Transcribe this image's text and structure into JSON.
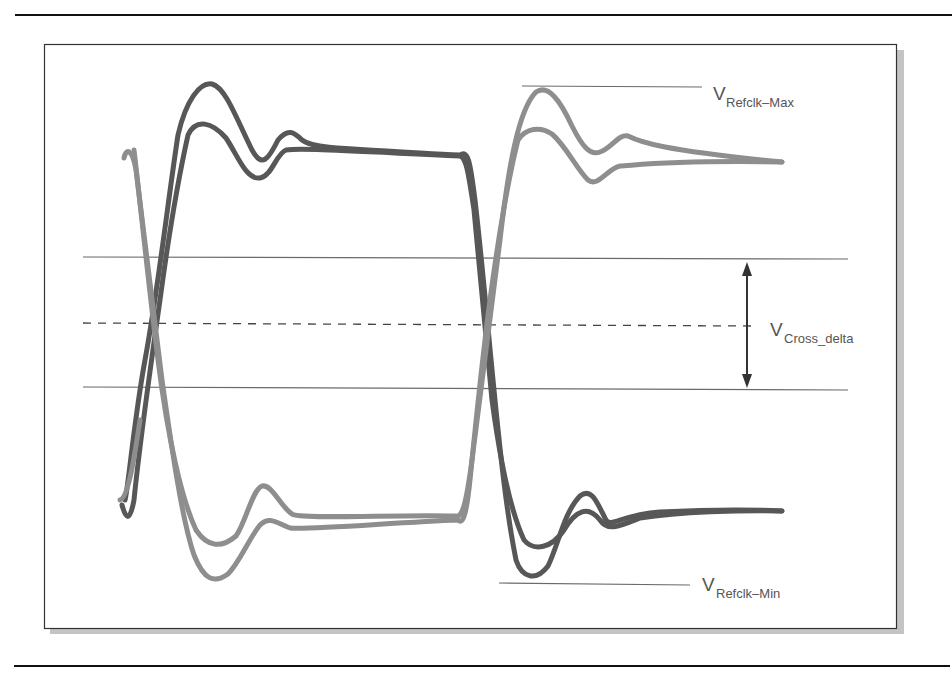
{
  "figure": {
    "type": "refclk-differential-waveform",
    "labels": {
      "max": {
        "main": "V",
        "sub": "Refclk–Max"
      },
      "cross": {
        "main": "V",
        "sub": "Cross_delta"
      },
      "min": {
        "main": "V",
        "sub": "Refclk–Min"
      }
    },
    "colors": {
      "dark_trace": "#555555",
      "light_trace": "#8c8c8c",
      "ref_line": "#6a6a6a",
      "frame": "#333333",
      "shadow": "#bdbdbd",
      "label": "#555555"
    },
    "annotations": [
      "Upper reference line at V_Refclk-Max touching peak of second rising edge",
      "Lower reference line at V_Refclk-Min touching trough of second falling edge",
      "Two horizontal solid lines bounding crossing region with dashed midline",
      "Double-headed vertical arrow indicating V_Cross_delta"
    ]
  }
}
